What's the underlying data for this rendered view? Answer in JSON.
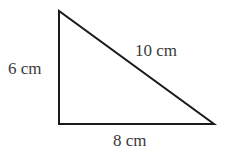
{
  "diagram": {
    "type": "right-triangle",
    "vertices": {
      "top": [
        59,
        11
      ],
      "right_angle": [
        59,
        124
      ],
      "right": [
        214,
        124
      ]
    },
    "stroke_color": "#1a1a1a",
    "text_color": "#3a3a3a",
    "labels": {
      "vertical_side": "6 cm",
      "hypotenuse": "10 cm",
      "base": "8 cm"
    }
  }
}
